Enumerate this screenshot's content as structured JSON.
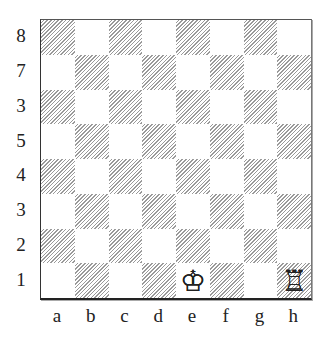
{
  "board": {
    "rank_labels": [
      "8",
      "7",
      "3",
      "5",
      "4",
      "3",
      "2",
      "1"
    ],
    "file_labels": [
      "a",
      "b",
      "c",
      "d",
      "e",
      "f",
      "g",
      "h"
    ],
    "light_color": "#ffffff",
    "dark_style": "diagonal-hatch",
    "pieces": [
      {
        "square": "e1",
        "piece": "white-king",
        "glyph": "♔"
      },
      {
        "square": "h1",
        "piece": "white-rook",
        "glyph": "♖"
      }
    ]
  }
}
